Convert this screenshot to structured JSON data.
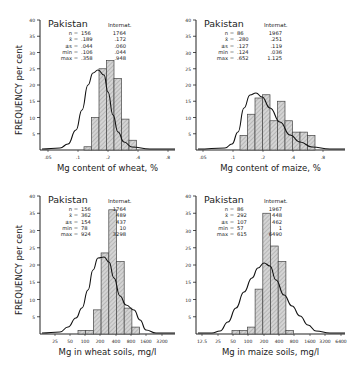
{
  "ylabel": "FREQUENCY per cent",
  "chart_data": [
    {
      "type": "bar",
      "title": "Pakistan",
      "xlabel": "Mg content of wheat, %",
      "ylabel": "FREQUENCY per cent",
      "ylim": [
        0,
        40
      ],
      "yticks": [
        5,
        10,
        15,
        20,
        25,
        30,
        35,
        40
      ],
      "xticks": [
        ".05",
        ".1",
        ".2",
        ".4",
        ".8"
      ],
      "stats_labels": [
        "n =",
        "x̄ =",
        "±s =",
        "min =",
        "max ="
      ],
      "pakistan": [
        "156",
        ".189",
        ".044",
        ".106",
        ".358"
      ],
      "internat_label": "Internat.",
      "internat": [
        "1764",
        ".172",
        ".060",
        ".044",
        ".948"
      ],
      "series": [
        {
          "name": "Pakistan",
          "values": [
            1,
            10,
            25,
            27.5,
            22,
            9.5,
            3
          ]
        }
      ],
      "curve": "International distribution (smooth curve)"
    },
    {
      "type": "bar",
      "title": "Pakistan",
      "xlabel": "Mg content of maize, %",
      "ylabel": "",
      "ylim": [
        0,
        40
      ],
      "yticks": [
        5,
        10,
        15,
        20,
        25,
        30,
        35,
        40
      ],
      "xticks": [
        ".05",
        ".1",
        ".2",
        ".4",
        ".8"
      ],
      "stats_labels": [
        "n =",
        "x̄ =",
        "±s =",
        "min =",
        "max ="
      ],
      "pakistan": [
        "86",
        ".280",
        ".127",
        ".124",
        ".652"
      ],
      "internat_label": "Internat.",
      "internat": [
        "1967",
        ".251",
        ".119",
        ".036",
        "1.125"
      ],
      "series": [
        {
          "name": "Pakistan",
          "values": [
            4.5,
            11,
            16,
            17,
            9,
            15,
            9,
            5.5,
            5.5,
            4.5
          ]
        }
      ],
      "curve": "International distribution (smooth curve)"
    },
    {
      "type": "bar",
      "title": "Pakistan",
      "xlabel": "Mg in wheat soils, mg/l",
      "ylabel": "FREQUENCY per cent",
      "ylim": [
        0,
        40
      ],
      "yticks": [
        5,
        10,
        15,
        20,
        25,
        30,
        35,
        40
      ],
      "xticks": [
        "25",
        "50",
        "100",
        "200",
        "400",
        "800",
        "1600",
        "3200"
      ],
      "stats_labels": [
        "n =",
        "x̄ =",
        "±s =",
        "min =",
        "max ="
      ],
      "pakistan": [
        "156",
        "362",
        "154",
        "78",
        "924"
      ],
      "internat_label": "Internat.",
      "internat": [
        "1764",
        "489",
        "437",
        "10",
        "3298"
      ],
      "series": [
        {
          "name": "Pakistan",
          "values": [
            1,
            1,
            7,
            23.5,
            36,
            21,
            7.5,
            2
          ]
        }
      ],
      "curve": "International distribution (smooth curve)"
    },
    {
      "type": "bar",
      "title": "Pakistan",
      "xlabel": "Mg in maize soils, mg/l",
      "ylabel": "",
      "ylim": [
        0,
        40
      ],
      "yticks": [
        5,
        10,
        15,
        20,
        25,
        30,
        35,
        40
      ],
      "xticks": [
        "12.5",
        "25",
        "50",
        "100",
        "200",
        "400",
        "800",
        "1600",
        "3200",
        "6400"
      ],
      "stats_labels": [
        "n =",
        "x̄ =",
        "±s =",
        "min =",
        "max ="
      ],
      "pakistan": [
        "86",
        "292",
        "107",
        "57",
        "615"
      ],
      "internat_label": "Internat.",
      "internat": [
        "1967",
        "448",
        "462",
        "1",
        "6490"
      ],
      "series": [
        {
          "name": "Pakistan",
          "values": [
            1,
            1,
            2,
            13,
            35,
            25.5,
            21,
            1
          ]
        }
      ],
      "curve": "International distribution (smooth curve)"
    }
  ],
  "colors": {
    "bar_fill": "#c8c8c8",
    "line": "#222222",
    "background": "#ffffff"
  }
}
